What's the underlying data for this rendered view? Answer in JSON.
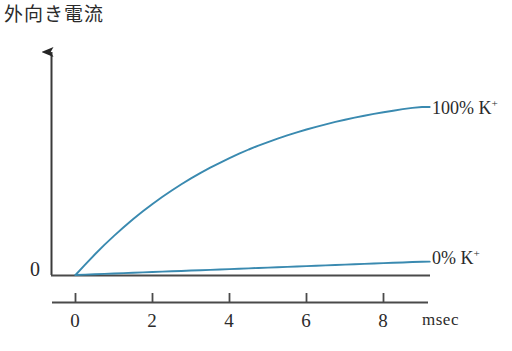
{
  "figure": {
    "y_axis_label": "外向き電流",
    "y_zero_label": "0",
    "x_unit_label": "msec",
    "x_tick_labels": [
      "0",
      "2",
      "4",
      "6",
      "8"
    ],
    "series_labels": {
      "high": "100% K",
      "high_charge": "+",
      "low": "0% K",
      "low_charge": "+"
    },
    "colors": {
      "curve": "#3a8ab0",
      "axis": "#3a3a3a",
      "text": "#2b2b2b",
      "background": "#ffffff"
    }
  },
  "chart_data": {
    "type": "line",
    "title": "",
    "xlabel": "msec",
    "ylabel": "外向き電流",
    "xlim": [
      0,
      9.2
    ],
    "ylim": [
      0,
      1.12
    ],
    "xticks": [
      0,
      2,
      4,
      6,
      8
    ],
    "yticks": [
      0
    ],
    "ytick_labels": [
      "0"
    ],
    "grid": false,
    "legend_position": "right-of-curve-end",
    "annotations": [
      "100% K+",
      "0% K+"
    ],
    "x": [
      0,
      0.25,
      0.5,
      0.75,
      1,
      1.25,
      1.5,
      1.75,
      2,
      2.25,
      2.5,
      2.75,
      3,
      3.25,
      3.5,
      3.75,
      4,
      4.25,
      4.5,
      4.75,
      5,
      5.25,
      5.5,
      5.75,
      6,
      6.25,
      6.5,
      6.75,
      7,
      7.25,
      7.5,
      7.75,
      8,
      8.25,
      8.5,
      8.75,
      9,
      9.2
    ],
    "series": [
      {
        "name": "100% K+",
        "color": "#3a8ab0",
        "values": [
          0,
          0.062,
          0.122,
          0.179,
          0.233,
          0.284,
          0.333,
          0.379,
          0.423,
          0.464,
          0.503,
          0.54,
          0.575,
          0.608,
          0.639,
          0.668,
          0.696,
          0.722,
          0.747,
          0.77,
          0.791,
          0.812,
          0.831,
          0.849,
          0.866,
          0.882,
          0.897,
          0.911,
          0.924,
          0.937,
          0.948,
          0.959,
          0.969,
          0.978,
          0.987,
          0.995,
          1.0,
          1.0
        ]
      },
      {
        "name": "0% K+",
        "color": "#3a8ab0",
        "values": [
          0,
          0.0022,
          0.0044,
          0.0066,
          0.0088,
          0.011,
          0.0132,
          0.0154,
          0.0176,
          0.0198,
          0.022,
          0.0242,
          0.0264,
          0.0286,
          0.0308,
          0.033,
          0.0352,
          0.0374,
          0.0396,
          0.0418,
          0.044,
          0.0462,
          0.0484,
          0.0506,
          0.0528,
          0.055,
          0.0572,
          0.0594,
          0.0616,
          0.0638,
          0.066,
          0.0682,
          0.0704,
          0.0726,
          0.0748,
          0.077,
          0.0785,
          0.0795
        ]
      }
    ]
  }
}
